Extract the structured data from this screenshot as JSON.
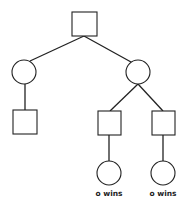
{
  "diagram": {
    "type": "game-tree",
    "colors": {
      "stroke": "#222222",
      "background": "#ffffff"
    },
    "nodes": [
      {
        "id": "root",
        "shape": "square",
        "x": 72,
        "y": 12,
        "w": 25,
        "h": 24
      },
      {
        "id": "c-left",
        "shape": "circle",
        "cx": 24,
        "cy": 72,
        "r": 12
      },
      {
        "id": "c-right",
        "shape": "circle",
        "cx": 138,
        "cy": 72,
        "r": 12
      },
      {
        "id": "s-left",
        "shape": "square",
        "x": 13,
        "y": 110,
        "w": 24,
        "h": 24
      },
      {
        "id": "s-mid",
        "shape": "square",
        "x": 98,
        "y": 111,
        "w": 23,
        "h": 24
      },
      {
        "id": "s-right",
        "shape": "square",
        "x": 152,
        "y": 111,
        "w": 23,
        "h": 24
      },
      {
        "id": "leaf-mid",
        "shape": "circle",
        "cx": 109,
        "cy": 173,
        "r": 12
      },
      {
        "id": "leaf-right",
        "shape": "circle",
        "cx": 163,
        "cy": 173,
        "r": 12
      }
    ],
    "edges": [
      {
        "from": "root",
        "to": "c-left",
        "x1": 84,
        "y1": 36,
        "x2": 30,
        "y2": 61
      },
      {
        "from": "root",
        "to": "c-right",
        "x1": 84,
        "y1": 36,
        "x2": 131,
        "y2": 62
      },
      {
        "from": "c-left",
        "to": "s-left",
        "x1": 25,
        "y1": 84,
        "x2": 25,
        "y2": 110
      },
      {
        "from": "c-right",
        "to": "s-mid",
        "x1": 138,
        "y1": 84,
        "x2": 110,
        "y2": 111
      },
      {
        "from": "c-right",
        "to": "s-right",
        "x1": 138,
        "y1": 84,
        "x2": 163,
        "y2": 111
      },
      {
        "from": "s-mid",
        "to": "leaf-mid",
        "x1": 109,
        "y1": 135,
        "x2": 109,
        "y2": 161
      },
      {
        "from": "s-right",
        "to": "leaf-right",
        "x1": 163,
        "y1": 135,
        "x2": 163,
        "y2": 161
      }
    ],
    "labels": [
      {
        "id": "label-leaf-mid",
        "text": "o wins",
        "x": 109,
        "y": 196
      },
      {
        "id": "label-leaf-right",
        "text": "o wins",
        "x": 163,
        "y": 196
      }
    ]
  }
}
